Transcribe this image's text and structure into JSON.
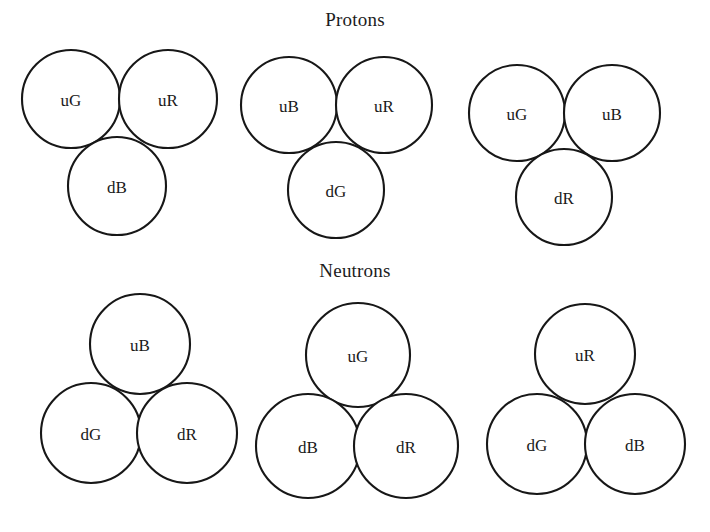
{
  "figure": {
    "background_color": "#ffffff",
    "stroke_color": "#171717",
    "text_color": "#1a1a1a",
    "width": 710,
    "height": 532
  },
  "sections": {
    "protons": {
      "title": "Protons"
    },
    "neutrons": {
      "title": "Neutrons"
    }
  },
  "chart_data": {
    "type": "diagram",
    "groups": [
      {
        "section": "Protons",
        "name": "proton-1",
        "quarks": [
          {
            "label": "uG",
            "flavor": "u",
            "color_charge": "G",
            "cx": 71,
            "cy": 99,
            "r": 49
          },
          {
            "label": "uR",
            "flavor": "u",
            "color_charge": "R",
            "cx": 168,
            "cy": 99,
            "r": 49
          },
          {
            "label": "dB",
            "flavor": "d",
            "color_charge": "B",
            "cx": 117,
            "cy": 186,
            "r": 49
          }
        ]
      },
      {
        "section": "Protons",
        "name": "proton-2",
        "quarks": [
          {
            "label": "uB",
            "flavor": "u",
            "color_charge": "B",
            "cx": 289,
            "cy": 105,
            "r": 48
          },
          {
            "label": "uR",
            "flavor": "u",
            "color_charge": "R",
            "cx": 384,
            "cy": 105,
            "r": 48
          },
          {
            "label": "dG",
            "flavor": "d",
            "color_charge": "G",
            "cx": 336,
            "cy": 190,
            "r": 48
          }
        ]
      },
      {
        "section": "Protons",
        "name": "proton-3",
        "quarks": [
          {
            "label": "uG",
            "flavor": "u",
            "color_charge": "G",
            "cx": 517,
            "cy": 113,
            "r": 48
          },
          {
            "label": "uB",
            "flavor": "u",
            "color_charge": "B",
            "cx": 612,
            "cy": 113,
            "r": 48
          },
          {
            "label": "dR",
            "flavor": "d",
            "color_charge": "R",
            "cx": 564,
            "cy": 197,
            "r": 48
          }
        ]
      },
      {
        "section": "Neutrons",
        "name": "neutron-1",
        "quarks": [
          {
            "label": "uB",
            "flavor": "u",
            "color_charge": "B",
            "cx": 140,
            "cy": 344,
            "r": 50
          },
          {
            "label": "dG",
            "flavor": "d",
            "color_charge": "G",
            "cx": 91,
            "cy": 433,
            "r": 50
          },
          {
            "label": "dR",
            "flavor": "d",
            "color_charge": "R",
            "cx": 187,
            "cy": 433,
            "r": 50
          }
        ]
      },
      {
        "section": "Neutrons",
        "name": "neutron-2",
        "quarks": [
          {
            "label": "uG",
            "flavor": "u",
            "color_charge": "G",
            "cx": 358,
            "cy": 355,
            "r": 52
          },
          {
            "label": "dB",
            "flavor": "d",
            "color_charge": "B",
            "cx": 308,
            "cy": 446,
            "r": 52
          },
          {
            "label": "dR",
            "flavor": "d",
            "color_charge": "R",
            "cx": 406,
            "cy": 446,
            "r": 52
          }
        ]
      },
      {
        "section": "Neutrons",
        "name": "neutron-3",
        "quarks": [
          {
            "label": "uR",
            "flavor": "u",
            "color_charge": "R",
            "cx": 585,
            "cy": 354,
            "r": 50
          },
          {
            "label": "dG",
            "flavor": "d",
            "color_charge": "G",
            "cx": 537,
            "cy": 444,
            "r": 50
          },
          {
            "label": "dB",
            "flavor": "d",
            "color_charge": "B",
            "cx": 635,
            "cy": 444,
            "r": 50
          }
        ]
      }
    ]
  }
}
